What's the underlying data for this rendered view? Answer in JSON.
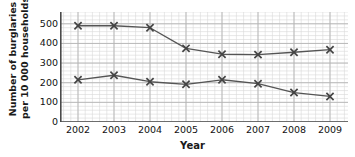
{
  "chart_data": {
    "type": "line",
    "title": "",
    "xlabel": "Year",
    "ylabel": "Number of burglaries per 10 000 households",
    "ylabel_line1": "Number of burglaries",
    "ylabel_line2": "per 10 000 households",
    "categories": [
      "2002",
      "2003",
      "2004",
      "2005",
      "2006",
      "2007",
      "2008",
      "2009"
    ],
    "x": [
      2002,
      2003,
      2004,
      2005,
      2006,
      2007,
      2008,
      2009
    ],
    "xlim": [
      2001.5,
      2009.5
    ],
    "ylim": [
      0,
      560
    ],
    "yticks": [
      0,
      100,
      200,
      300,
      400,
      500
    ],
    "ytick_labels": [
      "0",
      "100",
      "200",
      "300",
      "400",
      "500"
    ],
    "grid": true,
    "grid_minor": true,
    "grid_minor_step": 20,
    "legend": "none",
    "marker": "x",
    "series": [
      {
        "name": "upper-series",
        "values": [
          490,
          490,
          480,
          375,
          345,
          343,
          355,
          368
        ],
        "color": "#555555"
      },
      {
        "name": "lower-series",
        "values": [
          215,
          238,
          205,
          192,
          215,
          195,
          150,
          130
        ],
        "color": "#555555"
      }
    ],
    "colors": {
      "line": "#555555",
      "marker": "#444444",
      "axis": "#4a4a4a",
      "grid_major": "#b4b4b4",
      "grid_minor": "#d8d8d8",
      "text": "#111111",
      "background": "#ffffff"
    }
  }
}
